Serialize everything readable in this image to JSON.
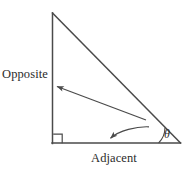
{
  "figure": {
    "type": "right-triangle-trigonometry-diagram",
    "background_color": "#ffffff",
    "stroke_color": "#4a4a4a",
    "text_color": "#2b2b2b",
    "labels": {
      "opposite": "Opposite",
      "adjacent": "Adjacent",
      "theta": "θ"
    },
    "geometry": {
      "apex": [
        52,
        13
      ],
      "right_angle_vertex": [
        52,
        143
      ],
      "theta_vertex": [
        180,
        143
      ],
      "right_angle_marker": {
        "x": 53,
        "y": 134,
        "size": 9
      },
      "angle_arc_radius": 22
    },
    "annotations": {
      "opposite_pointer": {
        "from": [
          146,
          120
        ],
        "to": [
          54,
          85
        ],
        "style": "straight-arrow"
      },
      "adjacent_pointer": {
        "from": [
          148,
          127
        ],
        "to": [
          107,
          140
        ],
        "style": "curved-arrow"
      }
    }
  }
}
